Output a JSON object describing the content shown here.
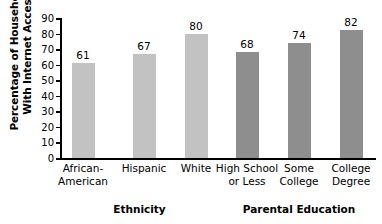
{
  "chart_data": {
    "type": "bar",
    "title": "",
    "xlabel": "",
    "ylabel": "Percentage of Households With Internet Access",
    "ylabel_line1": "Percentage of Households",
    "ylabel_line2": "With Internet Access",
    "ylim": [
      0,
      90
    ],
    "yticks": [
      0,
      10,
      20,
      30,
      40,
      50,
      60,
      70,
      80,
      90
    ],
    "ytick_labels": [
      "0",
      "10",
      "20",
      "30",
      "40",
      "50",
      "60",
      "70",
      "80",
      "90"
    ],
    "grid": false,
    "legend": "none",
    "categories": [
      "African-American",
      "Hispanic",
      "White",
      "High School or Less",
      "Some College",
      "College Degree"
    ],
    "values": [
      61,
      67,
      80,
      68,
      74,
      82
    ],
    "value_labels": [
      "61",
      "67",
      "80",
      "68",
      "74",
      "82"
    ],
    "groups": [
      {
        "label": "Ethnicity",
        "color": "#c2c2c2",
        "bars": [
          {
            "category_line1": "African-",
            "category_line2": "American",
            "value": 61,
            "value_label": "61"
          },
          {
            "category_line1": "Hispanic",
            "category_line2": "",
            "value": 67,
            "value_label": "67"
          },
          {
            "category_line1": "White",
            "category_line2": "",
            "value": 80,
            "value_label": "80"
          }
        ]
      },
      {
        "label": "Parental Education",
        "color": "#8e8e8e",
        "bars": [
          {
            "category_line1": "High School",
            "category_line2": "or Less",
            "value": 68,
            "value_label": "68"
          },
          {
            "category_line1": "Some",
            "category_line2": "College",
            "value": 74,
            "value_label": "74"
          },
          {
            "category_line1": "College",
            "category_line2": "Degree",
            "value": 82,
            "value_label": "82"
          }
        ]
      }
    ]
  }
}
